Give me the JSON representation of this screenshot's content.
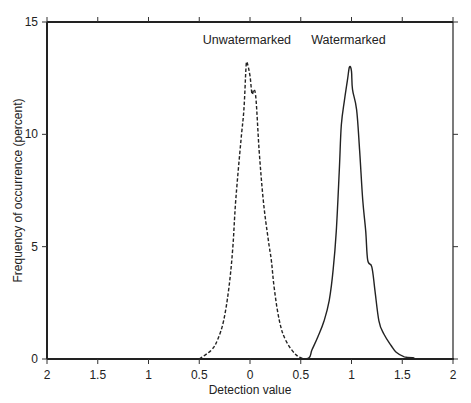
{
  "chart_data": {
    "type": "line",
    "title": "",
    "xlabel": "Detection value",
    "ylabel": "Frequency of occurrence (percent)",
    "xlim": [
      -2,
      2
    ],
    "ylim": [
      0,
      15
    ],
    "x_ticks": [
      -2,
      -1.5,
      -1,
      -0.5,
      0,
      0.5,
      1,
      1.5,
      2
    ],
    "x_tick_labels": [
      "2",
      "1.5",
      "1",
      "0.5",
      "0",
      "0.5",
      "1",
      "1.5",
      "2"
    ],
    "y_ticks": [
      0,
      5,
      10,
      15
    ],
    "y_tick_labels": [
      "0",
      "5",
      "10",
      "15"
    ],
    "grid": false,
    "legend": "none",
    "series": [
      {
        "name": "Unwatermarked",
        "style": "dashed",
        "color": "#222222",
        "x": [
          -0.5,
          -0.38,
          -0.32,
          -0.26,
          -0.21,
          -0.17,
          -0.14,
          -0.09,
          -0.06,
          -0.04,
          -0.03,
          0.0,
          0.02,
          0.04,
          0.06,
          0.09,
          0.13,
          0.18,
          0.21,
          0.24,
          0.29,
          0.35,
          0.45,
          0.53
        ],
        "y": [
          0,
          0.4,
          0.85,
          1.7,
          3.1,
          4.9,
          7.1,
          9.7,
          11.1,
          12.9,
          13.2,
          12.6,
          11.8,
          12.0,
          11.5,
          9.3,
          7.1,
          5.3,
          4.4,
          3.1,
          1.7,
          0.85,
          0.2,
          0
        ]
      },
      {
        "name": "Watermarked",
        "style": "solid",
        "color": "#222222",
        "x": [
          0.49,
          0.58,
          0.61,
          0.67,
          0.73,
          0.78,
          0.82,
          0.85,
          0.88,
          0.9,
          0.93,
          0.96,
          0.98,
          1.0,
          1.01,
          1.05,
          1.08,
          1.11,
          1.14,
          1.16,
          1.2,
          1.23,
          1.27,
          1.32,
          1.39,
          1.44,
          1.52,
          1.62
        ],
        "y": [
          0,
          0.05,
          0.4,
          1.0,
          1.7,
          2.6,
          4.0,
          5.7,
          8.4,
          10.4,
          11.5,
          12.4,
          13.0,
          12.8,
          12.0,
          11.1,
          9.3,
          7.1,
          5.7,
          4.4,
          4.1,
          3.1,
          1.7,
          1.1,
          0.6,
          0.3,
          0.1,
          0.05
        ]
      }
    ],
    "annotations": [
      {
        "text": "Unwatermarked",
        "x": -0.03,
        "y": 14.2
      },
      {
        "text": "Watermarked",
        "x": 0.97,
        "y": 14.2
      }
    ]
  }
}
